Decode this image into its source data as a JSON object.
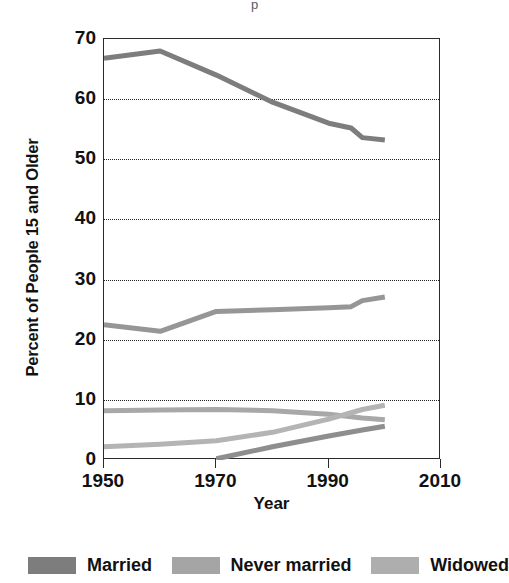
{
  "figure": {
    "title_remnant": "p",
    "background": "#ffffff"
  },
  "chart_data": {
    "type": "line",
    "title": "",
    "xlabel": "Year",
    "ylabel": "Percent of People 15 and Older",
    "xlim": [
      1950,
      2010
    ],
    "ylim": [
      0,
      70
    ],
    "xticks": [
      1950,
      1970,
      1990,
      2010
    ],
    "yticks": [
      0,
      10,
      20,
      30,
      40,
      50,
      60,
      70
    ],
    "grid": "horizontal-dotted",
    "legend_position": "below",
    "x": [
      1950,
      1960,
      1970,
      1980,
      1990,
      1995,
      2000
    ],
    "series": [
      {
        "name": "Married",
        "color": "#7d7d7d",
        "x": [
          1950,
          1960,
          1970,
          1980,
          1990,
          1994,
          1996,
          2000
        ],
        "values": [
          66.8,
          68.0,
          64.0,
          59.5,
          56.0,
          55.2,
          53.6,
          53.2
        ]
      },
      {
        "name": "Never married",
        "color": "#969696",
        "x": [
          1950,
          1960,
          1970,
          1980,
          1990,
          1994,
          1996,
          2000
        ],
        "values": [
          22.5,
          21.4,
          24.7,
          25.0,
          25.3,
          25.5,
          26.5,
          27.1
        ]
      },
      {
        "name": "Widowed",
        "color": "#a8a8a8",
        "x": [
          1950,
          1960,
          1970,
          1980,
          1990,
          1996,
          2000
        ],
        "values": [
          8.2,
          8.3,
          8.4,
          8.2,
          7.6,
          7.0,
          6.7
        ]
      },
      {
        "name": "Line 4",
        "color": "#b4b4b4",
        "x": [
          1950,
          1960,
          1970,
          1980,
          1990,
          1996,
          2000
        ],
        "values": [
          2.2,
          2.6,
          3.2,
          4.6,
          6.8,
          8.4,
          9.1
        ]
      },
      {
        "name": "Line 5",
        "color": "#8e8e8e",
        "x": [
          1970,
          1980,
          1990,
          1996,
          2000
        ],
        "values": [
          0.2,
          2.2,
          4.0,
          5.0,
          5.6
        ]
      }
    ]
  },
  "legend": {
    "items": [
      {
        "label": "Married",
        "color": "#7d7d7d"
      },
      {
        "label": "Never married",
        "color": "#a5a5a5"
      },
      {
        "label": "Widowed",
        "color": "#aeaeae"
      }
    ]
  }
}
